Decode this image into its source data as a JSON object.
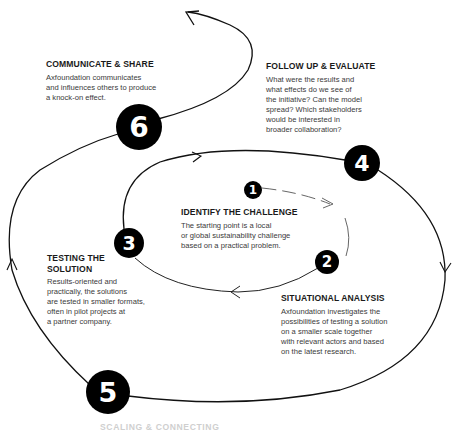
{
  "steps": [
    {
      "number": "1",
      "title": "IDENTIFY THE CHALLENGE",
      "body": [
        "The starting point is a local",
        "or global sustainability challenge",
        "based on a practical problem."
      ]
    },
    {
      "number": "2",
      "title": "SITUATIONAL ANALYSIS",
      "body": [
        "Axfoundation investigates the",
        "possibilities of testing a solution",
        "on a smaller scale together",
        "with relevant actors and based",
        "on the latest research."
      ]
    },
    {
      "number": "3",
      "title": [
        "TESTING THE",
        "SOLUTION"
      ],
      "body": [
        "Results-oriented and",
        "practically, the solutions",
        "are tested in smaller formats,",
        "often in pilot projects at",
        "a partner company."
      ]
    },
    {
      "number": "4",
      "title": "FOLLOW UP & EVALUATE",
      "body": [
        "What were the results and",
        "what effects do we see of",
        "the initiative? Can the model",
        "spread? Which stakeholders",
        "would be interested in",
        "broader collaboration?"
      ]
    },
    {
      "number": "5",
      "title": "SCALING & CONNECTING"
    },
    {
      "number": "6",
      "title": "COMMUNICATE & SHARE",
      "body": [
        "Axfoundation communicates",
        "and influences others to produce",
        "a knock-on effect."
      ]
    }
  ],
  "colors": {
    "line": "#1a1a1a",
    "badge": "#000000",
    "badge_text": "#ffffff",
    "text": "#3a3a3a"
  }
}
